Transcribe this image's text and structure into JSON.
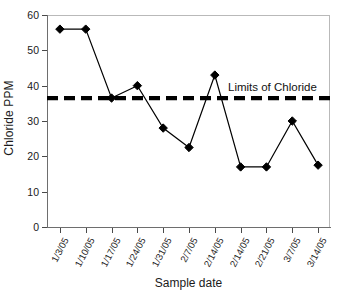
{
  "chart_data": {
    "type": "line",
    "title": "",
    "xlabel": "Sample date",
    "ylabel": "Chloride PPM",
    "categories": [
      "1/3/05",
      "1/10/05",
      "1/17/05",
      "1/24/05",
      "1/31/05",
      "2/7/05",
      "2/14/05",
      "2/14/05",
      "2/21/05",
      "3/7/05",
      "3/14/05"
    ],
    "values": [
      56,
      56,
      36.5,
      40,
      28,
      22.5,
      43,
      17,
      17,
      30,
      17.5
    ],
    "series": [
      {
        "name": "Chloride PPM",
        "values": [
          56,
          56,
          36.5,
          40,
          28,
          22.5,
          43,
          17,
          17,
          30,
          17.5
        ],
        "marker": "diamond",
        "color": "#000000"
      }
    ],
    "ylim": [
      0,
      60
    ],
    "yticks": [
      0,
      10,
      20,
      30,
      40,
      50,
      60
    ],
    "ytick_labels": [
      "0",
      "10",
      "20",
      "30",
      "40",
      "50",
      "60"
    ],
    "grid": false,
    "legend": "none",
    "reference_line": {
      "label": "Limits of Chloride",
      "value": 36.5,
      "style": "dashed",
      "color": "#000000"
    }
  },
  "axes": {
    "y_title": "Chloride PPM",
    "x_title": "Sample date"
  },
  "annotations": {
    "limit_label": "Limits of Chloride"
  },
  "colors": {
    "line": "#000000",
    "marker": "#000000",
    "limit_line": "#000000",
    "axis": "#6e6e6e",
    "frame": "#b9b9b9",
    "background": "#ffffff"
  }
}
